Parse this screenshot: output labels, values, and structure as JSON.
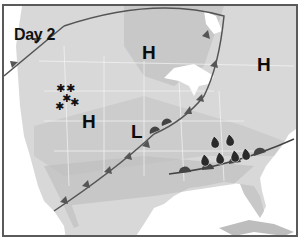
{
  "map": {
    "title": "Day 2",
    "colors": {
      "border": "#5a5a5a",
      "ocean": "#ffffff",
      "land_light": "#e6e6e6",
      "land_mid": "#d2d2d2",
      "land_dark": "#bdbdbd",
      "band_dark": "#b4b4b4",
      "front": "#555555",
      "symbol": "#0b0b0b"
    },
    "pressure_systems": [
      {
        "type": "high",
        "label": "H",
        "x": 140,
        "y": 39
      },
      {
        "type": "high",
        "label": "H",
        "x": 255,
        "y": 51
      },
      {
        "type": "high",
        "label": "H",
        "x": 80,
        "y": 108
      },
      {
        "type": "low",
        "label": "L",
        "x": 128,
        "y": 118
      }
    ],
    "fronts": [
      {
        "type": "cold",
        "description": "Cold front arcing from Pacific Northwest through Great Lakes"
      },
      {
        "type": "cold",
        "description": "Cold front from low over central plains to Baja California"
      },
      {
        "type": "warm",
        "description": "Warm/stationary front across southeast US"
      }
    ],
    "precipitation": [
      {
        "type": "snow",
        "symbol": "*",
        "count": 5,
        "region": "Northern Rockies"
      },
      {
        "type": "rain",
        "symbol": "raindrop",
        "count": 6,
        "region": "Southeast US"
      }
    ]
  }
}
